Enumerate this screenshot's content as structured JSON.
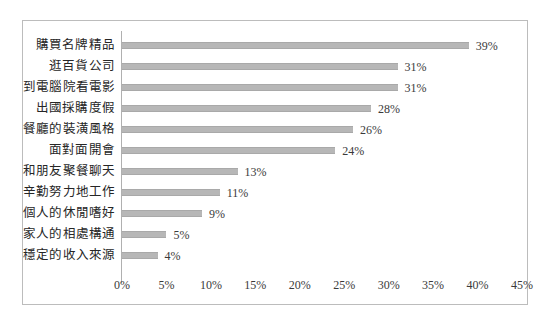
{
  "chart_data": {
    "type": "bar",
    "orientation": "horizontal",
    "title": "",
    "subtitle": "",
    "xlabel": "",
    "ylabel": "",
    "xlim": [
      0,
      45
    ],
    "grid": false,
    "legend": null,
    "xtick_labels": [
      "0%",
      "5%",
      "10%",
      "15%",
      "20%",
      "25%",
      "30%",
      "35%",
      "40%",
      "45%"
    ],
    "xtick_values": [
      0,
      5,
      10,
      15,
      20,
      25,
      30,
      35,
      40,
      45
    ],
    "bar_color": "#b7b7b7",
    "value_suffix": "%",
    "categories": [
      "購買名牌精品",
      "逛百貨公司",
      "到電腦院看電影",
      "出國採購度假",
      "餐廳的裝潢風格",
      "面對面開會",
      "和朋友聚餐聊天",
      "辛勤努力地工作",
      "個人的休閒嗜好",
      "家人的相處構通",
      "穩定的收入來源"
    ],
    "values": [
      39,
      31,
      31,
      28,
      26,
      24,
      13,
      11,
      9,
      5,
      4
    ],
    "value_labels": [
      "39%",
      "31%",
      "31%",
      "28%",
      "26%",
      "24%",
      "13%",
      "11%",
      "9%",
      "5%",
      "4%"
    ]
  }
}
